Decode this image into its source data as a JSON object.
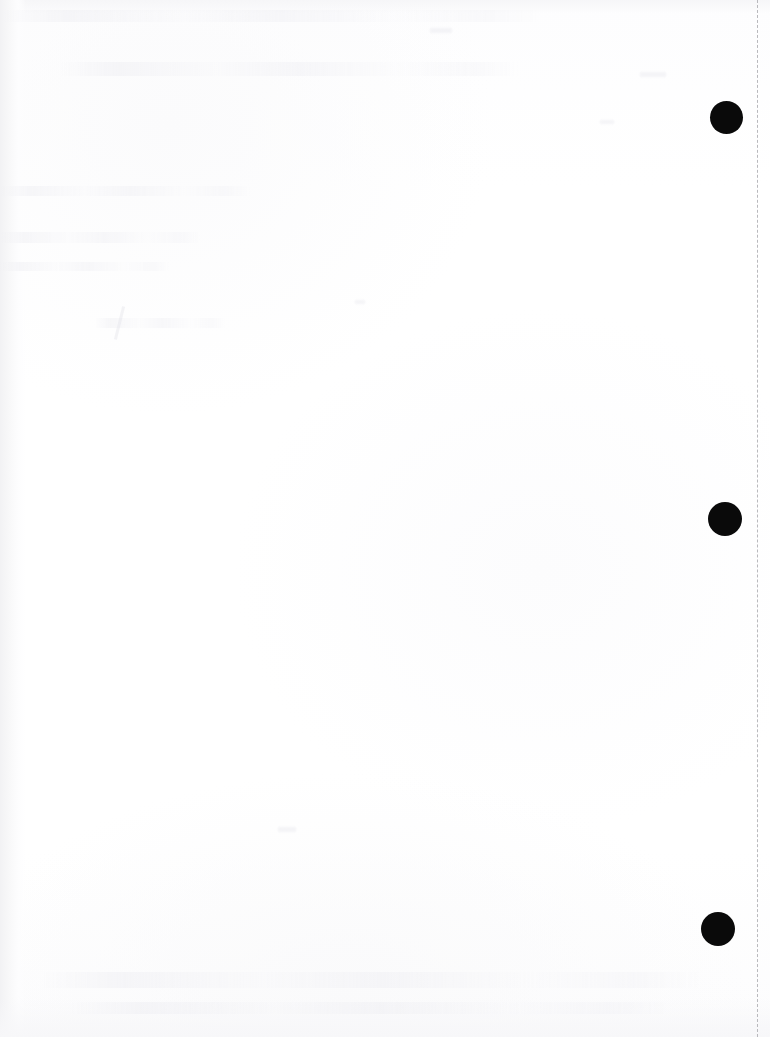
{
  "document": {
    "kind": "scanned-page",
    "title": "Scanned blank page",
    "page_width": 770,
    "page_height": 1037,
    "background_color": "#ffffff",
    "paper_tone": "#fdfdfe",
    "content_text": "",
    "content_note": "No legible text content; page is effectively blank"
  },
  "scan_edge": {
    "name": "dashed scan boundary",
    "style": "dashed",
    "orientation": "vertical",
    "color": "#b9b9bd",
    "x": 757,
    "dash_length": 4,
    "dash_gap": 5
  },
  "punch_holes": {
    "count": 3,
    "color": "#0a0a0a",
    "shape": "circle",
    "items": [
      {
        "label": "top hole punch",
        "cx": 726,
        "cy": 117,
        "diameter": 33
      },
      {
        "label": "middle hole punch",
        "cx": 725,
        "cy": 519,
        "diameter": 34
      },
      {
        "label": "bottom hole punch",
        "cx": 718,
        "cy": 929,
        "diameter": 34
      }
    ]
  },
  "artifacts": {
    "description": "Faint show-through ghosting from reverse side of sheet; illegible",
    "color": "#ecedf1",
    "bands": [
      {
        "label": "ghost band top",
        "x": 0,
        "y": 10,
        "width": 540,
        "height": 12
      },
      {
        "label": "ghost band upper",
        "x": 60,
        "y": 62,
        "width": 460,
        "height": 14
      },
      {
        "label": "ghost band left-upper",
        "x": 0,
        "y": 186,
        "width": 250,
        "height": 10
      },
      {
        "label": "ghost band left-mid",
        "x": 0,
        "y": 232,
        "width": 200,
        "height": 11
      },
      {
        "label": "ghost band left-low",
        "x": 0,
        "y": 262,
        "width": 170,
        "height": 9
      },
      {
        "label": "ghost band mid",
        "x": 95,
        "y": 318,
        "width": 130,
        "height": 10
      },
      {
        "label": "ghost band bottom",
        "x": 40,
        "y": 972,
        "width": 660,
        "height": 16
      },
      {
        "label": "ghost band footer",
        "x": 70,
        "y": 1002,
        "width": 600,
        "height": 12
      }
    ],
    "specks": [
      {
        "label": "speck a",
        "x": 278,
        "y": 827,
        "width": 18,
        "height": 5
      },
      {
        "label": "speck b",
        "x": 355,
        "y": 300,
        "width": 10,
        "height": 4
      },
      {
        "label": "speck c",
        "x": 600,
        "y": 120,
        "width": 14,
        "height": 4
      },
      {
        "label": "speck d",
        "x": 430,
        "y": 28,
        "width": 22,
        "height": 5
      },
      {
        "label": "speck e",
        "x": 640,
        "y": 72,
        "width": 26,
        "height": 5
      }
    ],
    "strokes": [
      {
        "label": "pencil stroke",
        "x": 118,
        "y": 306,
        "width": 3,
        "height": 34,
        "rotate": 14
      }
    ]
  }
}
